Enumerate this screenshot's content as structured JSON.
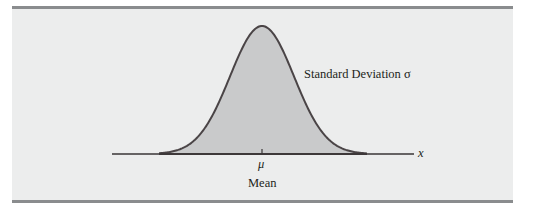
{
  "figure": {
    "type": "normal-distribution-diagram",
    "colors": {
      "background": "#eceded",
      "rule": "#8a8c8e",
      "curve_fill": "#c9cacb",
      "curve_stroke": "#4a4446",
      "axis": "#3a3536"
    },
    "labels": {
      "std_dev": "Standard Deviation σ",
      "mu": "μ",
      "mean": "Mean",
      "x_axis": "x"
    }
  }
}
